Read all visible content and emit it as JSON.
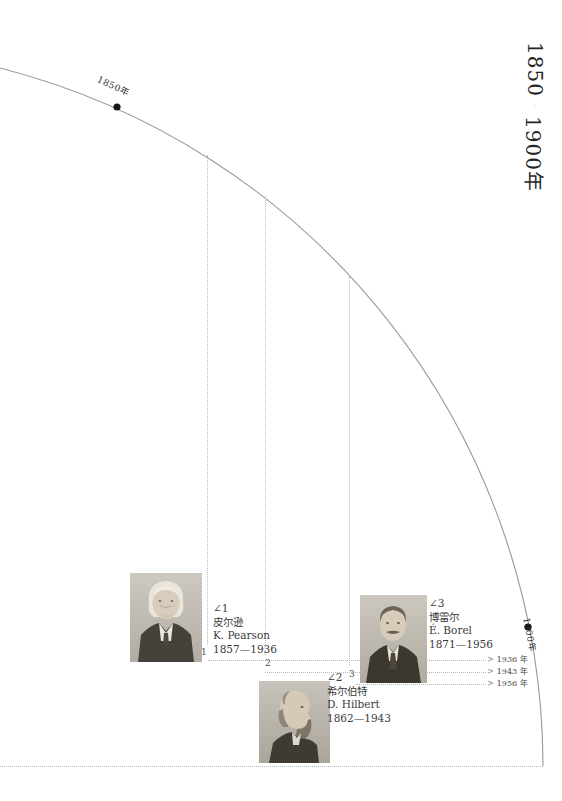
{
  "title": {
    "start_year": "1850",
    "end_year": "1900年"
  },
  "arc": {
    "start_label": "1850年",
    "end_label": "1900年"
  },
  "people": [
    {
      "marker": "1",
      "angle_label": "∠1",
      "name_zh": "皮尔逊",
      "name_en": "K. Pearson",
      "years": "1857—1936",
      "death_year_label": "1936 年"
    },
    {
      "marker": "2",
      "angle_label": "∠2",
      "name_zh": "希尔伯特",
      "name_en": "D. Hilbert",
      "years": "1862—1943",
      "death_year_label": "1943 年"
    },
    {
      "marker": "3",
      "angle_label": "∠3",
      "name_zh": "博雷尔",
      "name_en": "É. Borel",
      "years": "1871—1956",
      "death_year_label": "1956 年"
    }
  ],
  "colors": {
    "arc_line": "#9a9a9a",
    "dotted_line": "#b9b9b9",
    "dot": "#161616",
    "text": "#3a3a3a"
  }
}
